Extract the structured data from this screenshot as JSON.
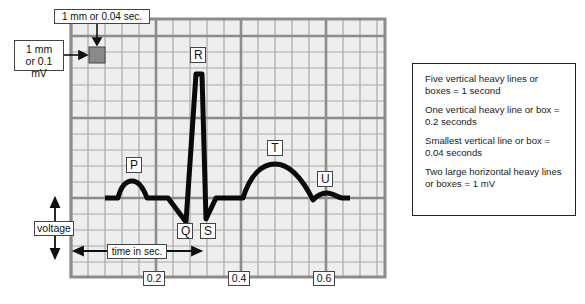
{
  "diagram": {
    "colors": {
      "paper": "#eeeeee",
      "minor_grid": "#a8a8a8",
      "major_grid": "#8c8c8c",
      "trace": "#0a0a0a",
      "sample_box": "#8a8a8a"
    },
    "callouts": {
      "time_box": "1 mm or 0.04 sec.",
      "voltage_box_line1": "1 mm",
      "voltage_box_line2": "or 0.1 mV"
    },
    "waves": {
      "P": "P",
      "Q": "Q",
      "R": "R",
      "S": "S",
      "T": "T",
      "U": "U"
    },
    "axes": {
      "voltage_label": "voltage",
      "time_label": "time in sec.",
      "ticks": [
        "0.2",
        "0.4",
        "0.6"
      ]
    },
    "legend": {
      "items": [
        "Five vertical heavy lines or boxes = 1 second",
        "One vertical heavy line or box = 0.2 seconds",
        "Smallest vertical line or box = 0.04 seconds",
        "Two large horizontal heavy lines or boxes = 1 mV"
      ]
    }
  }
}
